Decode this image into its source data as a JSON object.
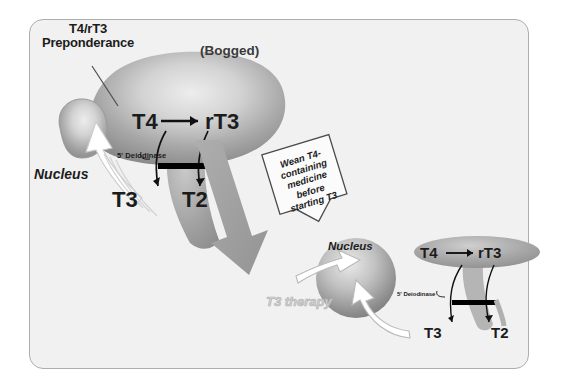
{
  "figure": {
    "panel": {
      "background_color": "#f1f1f1",
      "border_color": "#adadad"
    },
    "top_panel": {
      "caption_preponderance": "T4/rT3\nPreponderance",
      "caption_bogged": "(Bogged)",
      "cell_label": "Nucleus",
      "enzyme_label": "5' Deiodinase",
      "hormone_t4": "T4",
      "hormone_rt3": "rT3",
      "hormone_t3": "T3",
      "hormone_t2": "T2",
      "blob_color_light": "#e6e6e6",
      "blob_color_dark": "#8e8e8e",
      "big_arrow_color": "#9e9e9e"
    },
    "callout": {
      "text": "Wean T4-\ncontaining\nmedicine\nbefore\nstarting T3",
      "shape": "down-arrow-banner",
      "fill": "#fbfbfb",
      "stroke": "#4a4a4a"
    },
    "bottom_panel": {
      "therapy_label": "T3\ntherapy",
      "therapy_color": "#d2d2d2",
      "cell_label": "Nucleus",
      "enzyme_label": "5' Deiodinase",
      "hormone_t4": "T4",
      "hormone_rt3": "rT3",
      "hormone_t3": "T3",
      "hormone_t2": "T2",
      "nucleus_color_light": "#e2e2e2",
      "nucleus_color_dark": "#868686"
    }
  }
}
